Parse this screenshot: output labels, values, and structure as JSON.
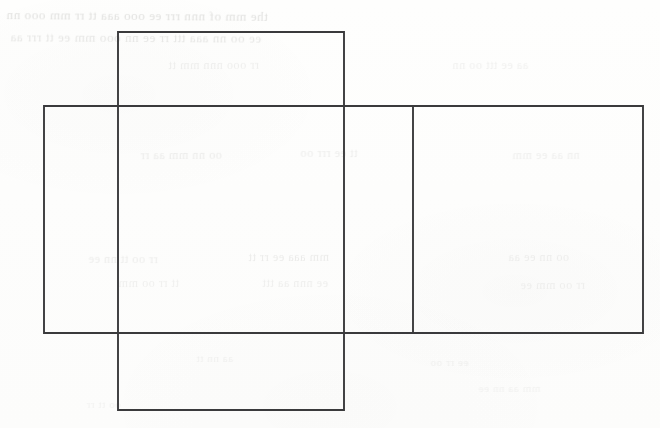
{
  "document": {
    "kind": "scanned-worksheet-page",
    "background_color": "#fdfdfc",
    "width": 660,
    "height": 428
  },
  "figure": {
    "stroke_color": "#3a3a3c",
    "stroke_width": 1.9,
    "fill": "none",
    "faces": [
      {
        "name": "vertical-strip",
        "role": "top-flap-through-bottom-flap",
        "x": 118,
        "y": 32,
        "width": 226,
        "height": 378
      },
      {
        "name": "horizontal-band",
        "role": "side-faces-row",
        "x": 44,
        "y": 106,
        "width": 599,
        "height": 227
      }
    ],
    "internal_edges": [
      {
        "name": "right-divider",
        "orientation": "vertical",
        "x": 413,
        "y1": 106,
        "y2": 333
      }
    ],
    "regions": [
      {
        "name": "top-flap",
        "x": 118,
        "y": 32,
        "width": 226,
        "height": 74
      },
      {
        "name": "left-face",
        "x": 44,
        "y": 106,
        "width": 74,
        "height": 227
      },
      {
        "name": "center-face",
        "x": 118,
        "y": 106,
        "width": 226,
        "height": 227
      },
      {
        "name": "middle-face",
        "x": 344,
        "y": 106,
        "width": 69,
        "height": 227
      },
      {
        "name": "right-face",
        "x": 413,
        "y": 106,
        "width": 230,
        "height": 227
      },
      {
        "name": "bottom-flap",
        "x": 118,
        "y": 333,
        "width": 226,
        "height": 77
      }
    ]
  },
  "bleed_through": {
    "note": "illegible faint mirrored text showing through from the reverse side of the page",
    "color": "#b9b9b6",
    "lines": [
      {
        "text": "the  mm  of  nnn  rrr  ee  ooo  aaa  tt  rr  mm  ooo  nn",
        "x": 6,
        "y": 8,
        "size": 13,
        "opacity": 0.42,
        "rotate": -0.4
      },
      {
        "text": "ee  oo  nn  aaa  ttt  rr  ee  nn  ooo  mm  ee  tt  rrr  aa",
        "x": 10,
        "y": 30,
        "size": 13,
        "opacity": 0.34,
        "rotate": -0.3
      },
      {
        "text": "rr  ooo  nnn  mm  tt",
        "x": 168,
        "y": 58,
        "size": 12,
        "opacity": 0.22,
        "rotate": 0.2
      },
      {
        "text": "aa  ee  ttt  oo  nn",
        "x": 452,
        "y": 58,
        "size": 12,
        "opacity": 0.2,
        "rotate": 0.1
      },
      {
        "text": "oo  nn  mm  aa  rr",
        "x": 140,
        "y": 148,
        "size": 12,
        "opacity": 0.26,
        "rotate": 0.3
      },
      {
        "text": "tt  ee  rrr  oo",
        "x": 300,
        "y": 146,
        "size": 12,
        "opacity": 0.24,
        "rotate": -0.2
      },
      {
        "text": "nn  aa  ee  mm",
        "x": 512,
        "y": 148,
        "size": 12,
        "opacity": 0.22,
        "rotate": 0.2
      },
      {
        "text": "rr  oo  tt  nn  ee",
        "x": 88,
        "y": 252,
        "size": 12,
        "opacity": 0.24,
        "rotate": -0.3
      },
      {
        "text": "mm  aaa  ee  rr  tt",
        "x": 248,
        "y": 250,
        "size": 12,
        "opacity": 0.26,
        "rotate": 0.2
      },
      {
        "text": "oo  nn  ee  aa",
        "x": 508,
        "y": 250,
        "size": 12,
        "opacity": 0.22,
        "rotate": 0.1
      },
      {
        "text": "tt  rr  oo  mm",
        "x": 118,
        "y": 276,
        "size": 12,
        "opacity": 0.2,
        "rotate": 0.2
      },
      {
        "text": "ee  nnn  aa  ttt",
        "x": 262,
        "y": 276,
        "size": 12,
        "opacity": 0.22,
        "rotate": -0.2
      },
      {
        "text": "rr  oo  mm  ee",
        "x": 520,
        "y": 278,
        "size": 12,
        "opacity": 0.2,
        "rotate": 0.3
      },
      {
        "text": "aa  nn  tt",
        "x": 196,
        "y": 352,
        "size": 11,
        "opacity": 0.18,
        "rotate": 0.2
      },
      {
        "text": "ee  rr  oo",
        "x": 430,
        "y": 356,
        "size": 11,
        "opacity": 0.18,
        "rotate": -0.2
      },
      {
        "text": "mm  aa  nn  ee",
        "x": 478,
        "y": 382,
        "size": 11,
        "opacity": 0.16,
        "rotate": 0.2
      },
      {
        "text": "oo  tt  rr",
        "x": 86,
        "y": 398,
        "size": 11,
        "opacity": 0.16,
        "rotate": 0.1
      }
    ]
  }
}
